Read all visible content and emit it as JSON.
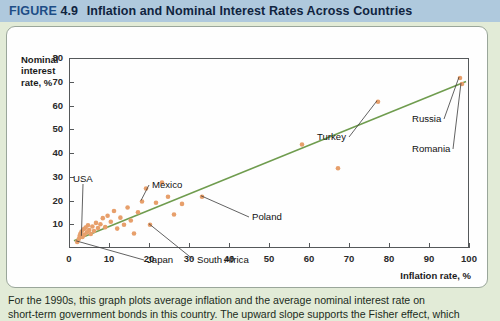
{
  "header": {
    "figure_word": "FIGURE",
    "figure_number": "4.9",
    "title": "Inflation and Nominal Interest Rates Across Countries"
  },
  "chart_data": {
    "type": "scatter",
    "title": "Inflation and Nominal Interest Rates Across Countries",
    "xlabel": "Inflation rate, %",
    "ylabel": "Nominal interest rate, %",
    "xlim": [
      0,
      100
    ],
    "ylim": [
      0,
      80
    ],
    "xticks": [
      0,
      10,
      20,
      30,
      40,
      50,
      60,
      70,
      80,
      90,
      100
    ],
    "yticks": [
      10,
      20,
      30,
      40,
      50,
      60,
      70,
      80
    ],
    "grid": false,
    "legend": "none",
    "series": [
      {
        "name": "Countries",
        "marker_color": "#e79f6b",
        "points": [
          {
            "x": 1.8,
            "y": 3.0,
            "label": "Japan"
          },
          {
            "x": 2.2,
            "y": 4.2,
            "label": ""
          },
          {
            "x": 2.4,
            "y": 5.5,
            "label": ""
          },
          {
            "x": 2.6,
            "y": 6.4,
            "label": ""
          },
          {
            "x": 2.9,
            "y": 7.4,
            "label": ""
          },
          {
            "x": 3.1,
            "y": 5.1,
            "label": "USA"
          },
          {
            "x": 3.4,
            "y": 8.3,
            "label": ""
          },
          {
            "x": 3.6,
            "y": 6.0,
            "label": ""
          },
          {
            "x": 3.9,
            "y": 9.0,
            "label": ""
          },
          {
            "x": 4.2,
            "y": 7.0,
            "label": ""
          },
          {
            "x": 4.5,
            "y": 10.0,
            "label": ""
          },
          {
            "x": 4.8,
            "y": 8.0,
            "label": ""
          },
          {
            "x": 5.2,
            "y": 6.3,
            "label": ""
          },
          {
            "x": 5.6,
            "y": 9.5,
            "label": ""
          },
          {
            "x": 6.0,
            "y": 7.6,
            "label": ""
          },
          {
            "x": 6.5,
            "y": 11.0,
            "label": ""
          },
          {
            "x": 7.0,
            "y": 8.8,
            "label": ""
          },
          {
            "x": 7.6,
            "y": 10.4,
            "label": ""
          },
          {
            "x": 8.2,
            "y": 13.0,
            "label": ""
          },
          {
            "x": 8.8,
            "y": 9.2,
            "label": ""
          },
          {
            "x": 9.4,
            "y": 14.0,
            "label": ""
          },
          {
            "x": 10.2,
            "y": 11.5,
            "label": ""
          },
          {
            "x": 11.0,
            "y": 16.0,
            "label": ""
          },
          {
            "x": 11.8,
            "y": 8.6,
            "label": ""
          },
          {
            "x": 12.6,
            "y": 13.2,
            "label": ""
          },
          {
            "x": 13.5,
            "y": 10.2,
            "label": ""
          },
          {
            "x": 14.4,
            "y": 17.5,
            "label": ""
          },
          {
            "x": 15.2,
            "y": 12.0,
            "label": ""
          },
          {
            "x": 16.0,
            "y": 6.5,
            "label": ""
          },
          {
            "x": 17.0,
            "y": 15.5,
            "label": ""
          },
          {
            "x": 18.0,
            "y": 20.0,
            "label": "Mexico"
          },
          {
            "x": 19.0,
            "y": 25.5,
            "label": ""
          },
          {
            "x": 20.0,
            "y": 10.2,
            "label": "South Africa"
          },
          {
            "x": 21.5,
            "y": 19.5,
            "label": ""
          },
          {
            "x": 23.0,
            "y": 28.0,
            "label": ""
          },
          {
            "x": 24.5,
            "y": 22.0,
            "label": ""
          },
          {
            "x": 26.0,
            "y": 14.5,
            "label": ""
          },
          {
            "x": 28.0,
            "y": 19.0,
            "label": ""
          },
          {
            "x": 33.0,
            "y": 22.0,
            "label": "Poland"
          },
          {
            "x": 58.0,
            "y": 44.0,
            "label": ""
          },
          {
            "x": 67.0,
            "y": 34.0,
            "label": ""
          },
          {
            "x": 77.0,
            "y": 62.0,
            "label": "Turkey"
          },
          {
            "x": 97.5,
            "y": 72.0,
            "label": "Russia"
          },
          {
            "x": 98.0,
            "y": 69.5,
            "label": "Romania"
          }
        ]
      }
    ],
    "trend_line": {
      "name": "45-degree / fitted line",
      "color": "#6f9c4e",
      "x0": 1.0,
      "y0": 3.5,
      "x1": 99.0,
      "y1": 70.5
    },
    "annotations": [
      {
        "text": "Nominal interest rate, %",
        "role": "y-axis-title"
      },
      {
        "text": "Inflation rate, %",
        "role": "x-axis-title"
      },
      {
        "text": "USA",
        "role": "point-callout"
      },
      {
        "text": "Japan",
        "role": "point-callout"
      },
      {
        "text": "Mexico",
        "role": "point-callout"
      },
      {
        "text": "South Africa",
        "role": "point-callout"
      },
      {
        "text": "Poland",
        "role": "point-callout"
      },
      {
        "text": "Turkey",
        "role": "point-callout"
      },
      {
        "text": "Russia",
        "role": "point-callout"
      },
      {
        "text": "Romania",
        "role": "point-callout"
      }
    ]
  },
  "axis": {
    "y_title_line1": "Nominal",
    "y_title_line2": "interest",
    "y_title_line3": "rate, %",
    "x_title": "Inflation rate, %"
  },
  "callouts": {
    "usa": "USA",
    "japan": "Japan",
    "mexico": "Mexico",
    "south_africa": "South Africa",
    "poland": "Poland",
    "turkey": "Turkey",
    "russia": "Russia",
    "romania": "Romania"
  },
  "caption": {
    "line1": "For the 1990s, this graph plots average inflation and the average nominal interest rate on",
    "line2": "short-term government bonds in this country. The upward slope supports the Fisher effect, which"
  },
  "colors": {
    "header_bg": "#afc9dd",
    "header_text": "#10243f",
    "page_bg": "#e2ebd7",
    "card_bg": "#fefefe",
    "marker": "#e79f6b",
    "trend_line": "#6f9c4e",
    "axis": "#55585a"
  }
}
